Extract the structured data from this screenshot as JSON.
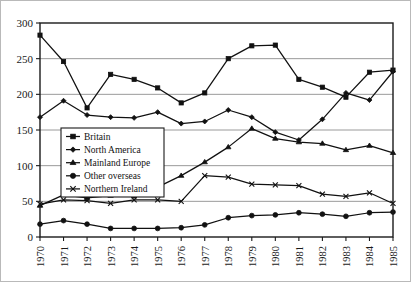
{
  "chart_data": {
    "type": "line",
    "title": "",
    "xlabel": "",
    "ylabel": "",
    "x": [
      1970,
      1971,
      1972,
      1973,
      1974,
      1975,
      1976,
      1977,
      1978,
      1979,
      1980,
      1981,
      1982,
      1983,
      1984,
      1985
    ],
    "categories": [
      "1970",
      "1971",
      "1972",
      "1973",
      "1974",
      "1975",
      "1976",
      "1977",
      "1978",
      "1979",
      "1980",
      "1981",
      "1982",
      "1983",
      "1984",
      "1985"
    ],
    "ylim": [
      0,
      300
    ],
    "yticks": [
      0,
      50,
      100,
      150,
      200,
      250,
      300
    ],
    "ytick_labels": [
      "0",
      "50",
      "100",
      "150",
      "200",
      "250",
      "300"
    ],
    "grid": true,
    "grid_axis": "y",
    "legend_position": "center-left",
    "series": [
      {
        "name": "Britain",
        "marker": "filled-square",
        "values": [
          283,
          246,
          181,
          228,
          221,
          209,
          188,
          202,
          250,
          268,
          269,
          221,
          210,
          196,
          231,
          234
        ]
      },
      {
        "name": "North America",
        "marker": "filled-diamond",
        "values": [
          168,
          191,
          171,
          168,
          167,
          175,
          159,
          162,
          178,
          168,
          147,
          136,
          165,
          202,
          192,
          232
        ]
      },
      {
        "name": "Mainland Europe",
        "marker": "filled-triangle",
        "values": [
          44,
          59,
          55,
          58,
          57,
          70,
          86,
          105,
          126,
          152,
          138,
          133,
          131,
          122,
          128,
          118
        ]
      },
      {
        "name": "Other overseas",
        "marker": "filled-circle",
        "values": [
          18,
          23,
          18,
          12,
          12,
          12,
          13,
          17,
          27,
          30,
          31,
          34,
          32,
          29,
          34,
          35
        ]
      },
      {
        "name": "Northern Ireland",
        "marker": "cross-x",
        "values": [
          46,
          52,
          51,
          47,
          52,
          52,
          50,
          86,
          84,
          74,
          73,
          72,
          60,
          57,
          62,
          47
        ]
      }
    ]
  }
}
